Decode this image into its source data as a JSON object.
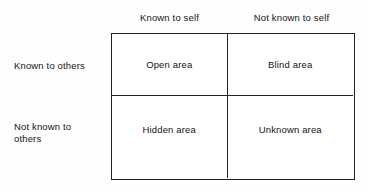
{
  "figure": {
    "name": "johari-window",
    "columns": [
      {
        "id": "known-to-self",
        "label": "Known to self"
      },
      {
        "id": "not-known-to-self",
        "label": "Not known to self"
      }
    ],
    "rows": [
      {
        "id": "known-to-others",
        "label": "Known to others"
      },
      {
        "id": "not-known-to-others",
        "label": "Not known to\nothers"
      }
    ],
    "quadrants": [
      {
        "id": "open-area",
        "label": "Open area",
        "row": "known-to-others",
        "column": "known-to-self"
      },
      {
        "id": "blind-area",
        "label": "Blind area",
        "row": "known-to-others",
        "column": "not-known-to-self"
      },
      {
        "id": "hidden-area",
        "label": "Hidden area",
        "row": "not-known-to-others",
        "column": "known-to-self"
      },
      {
        "id": "unknown-area",
        "label": "Unknown area",
        "row": "not-known-to-others",
        "column": "not-known-to-self"
      }
    ],
    "colors": {
      "background": "#fefefe",
      "cell_background": "#ffffff",
      "border": "#222222",
      "text": "#141414"
    }
  }
}
